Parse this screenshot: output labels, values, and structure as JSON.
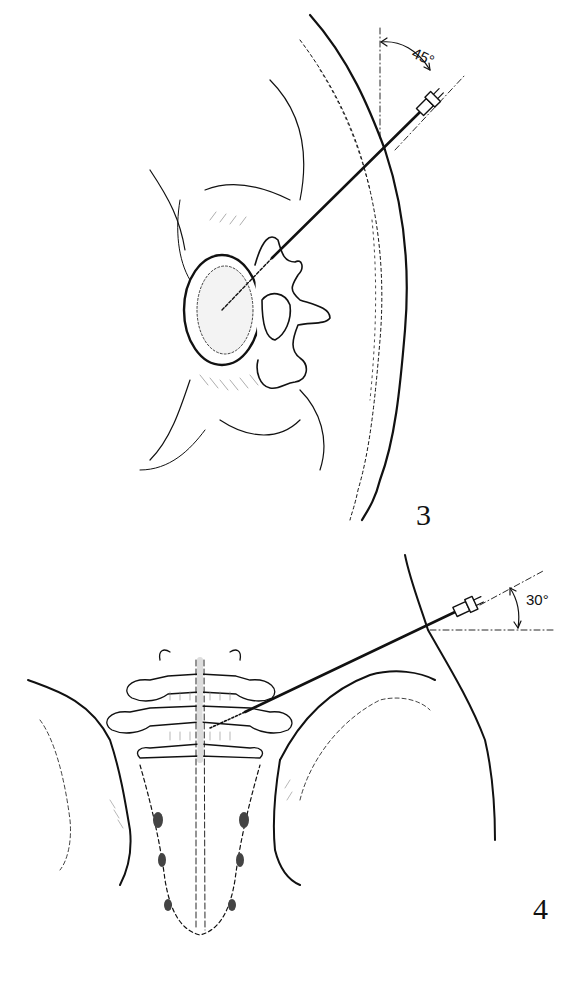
{
  "figures": [
    {
      "id": "3",
      "label": "3",
      "view": "axial cross-section of lumbar vertebra",
      "angle_label": "45°",
      "elements": [
        "vertebral-body",
        "transverse-process",
        "spinous-process",
        "psoas-muscle",
        "skin-surface",
        "needle"
      ]
    },
    {
      "id": "4",
      "label": "4",
      "view": "posterior view of lumbar spine and sacrum",
      "angle_label": "30°",
      "elements": [
        "lumbar-vertebrae",
        "sacrum",
        "iliac-crest",
        "skin-surface",
        "needle"
      ]
    }
  ],
  "colors": {
    "ink": "#111111",
    "background": "#ffffff",
    "shade": "#9a9a9a"
  }
}
